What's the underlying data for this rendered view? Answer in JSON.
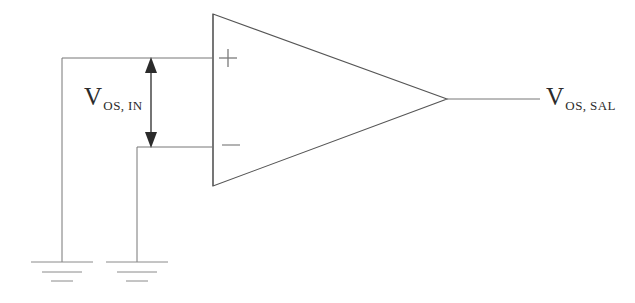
{
  "figure": {
    "background_color": "#ffffff",
    "line_color": "#4a4a4a",
    "text_color": "#2b2b2b"
  },
  "labels": {
    "input_offset": {
      "symbol": "V",
      "subscript": "OS, IN",
      "full": "V OS, IN"
    },
    "output_offset": {
      "symbol": "V",
      "subscript": "OS, SAL",
      "full": "V OS, SAL"
    },
    "noninverting_terminal": "+",
    "inverting_terminal": "–"
  },
  "components": {
    "opamp": {
      "name": "operational-amplifier",
      "shape": "triangle",
      "left_edge_x": 213,
      "top_y": 14,
      "bottom_y": 186,
      "apex_x": 447,
      "apex_y": 99
    },
    "ground_left": {
      "name": "ground-symbol-left",
      "x": 62,
      "bars_y": [
        262,
        272,
        281
      ],
      "bar_widths": [
        62,
        40,
        22
      ]
    },
    "ground_right": {
      "name": "ground-symbol-right",
      "x": 137,
      "bars_y": [
        262,
        272,
        281
      ],
      "bar_widths": [
        62,
        40,
        22
      ]
    },
    "offset_arrow": {
      "name": "double-headed-arrow",
      "x": 151,
      "top_y": 58,
      "bottom_y": 147
    }
  },
  "wires": {
    "noninverting_input": {
      "from_x": 62,
      "from_y": 58,
      "to_x": 213,
      "to_y": 58
    },
    "inverting_input": {
      "from_x": 137,
      "from_y": 147,
      "to_x": 213,
      "to_y": 147
    },
    "left_ground_drop": {
      "x": 62,
      "from_y": 58,
      "to_y": 262
    },
    "right_ground_drop": {
      "x": 137,
      "from_y": 147,
      "to_y": 262
    },
    "output": {
      "from_x": 447,
      "from_y": 99,
      "to_x": 540,
      "to_y": 99
    }
  }
}
